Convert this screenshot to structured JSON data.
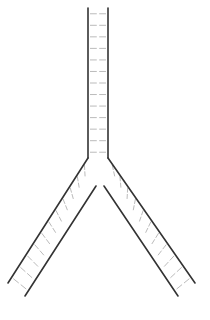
{
  "diagram": {
    "type": "y-shaped double-stranded replication fork",
    "colors": {
      "background": "#ffffff",
      "strand": "#333333",
      "rung": "#bbbbbb"
    },
    "parent_duplex": {
      "left_strand": [
        [
          88,
          8
        ],
        [
          88,
          158
        ]
      ],
      "right_strand": [
        [
          108,
          8
        ],
        [
          108,
          158
        ]
      ],
      "rung_count": 13
    },
    "left_daughter": {
      "outer_strand": [
        [
          88,
          158
        ],
        [
          8,
          283
        ]
      ],
      "inner_strand": [
        [
          96,
          186
        ],
        [
          25,
          296
        ]
      ],
      "rung_count": 11
    },
    "right_daughter": {
      "outer_strand": [
        [
          108,
          158
        ],
        [
          195,
          283
        ]
      ],
      "inner_strand": [
        [
          104,
          186
        ],
        [
          178,
          296
        ]
      ],
      "rung_count": 11
    }
  }
}
